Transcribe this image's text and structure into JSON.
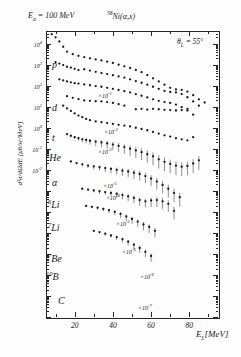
{
  "figure": {
    "beam_energy_label": "E",
    "beam_energy_sub": "α",
    "beam_energy_value": " = 100  MeV",
    "reaction_isotope": "58",
    "reaction_target": "Ni",
    "reaction_channel": "(α,x)",
    "angle_label": "θ",
    "angle_sub": "L",
    "angle_value": " = 55°"
  },
  "axes": {
    "ylabel": "d²σ/dΩdE [μb/sr/MeV]",
    "xlabel": "E",
    "xlabel_sub": "L",
    "xlabel_unit": "[MeV]",
    "y_ticks": [
      "10⁴",
      "10³",
      "10²",
      "10¹",
      "10⁰",
      "10⁻¹",
      "10⁻²"
    ],
    "y_tick_exps": [
      4,
      3,
      2,
      1,
      0,
      -1,
      -2
    ],
    "x_ticks": [
      "20",
      "40",
      "60",
      "80"
    ],
    "x_tick_values": [
      20,
      40,
      60,
      80
    ]
  },
  "chart_data": {
    "type": "scatter",
    "xlabel": "E_L [MeV]",
    "ylabel": "d²σ/dΩdE [μb/sr/MeV]",
    "xlim": [
      5,
      95
    ],
    "ylim_exp": [
      -9,
      4.6
    ],
    "grid": false,
    "legend": "none",
    "log_y": true,
    "series": [
      {
        "name": "p",
        "label": "p",
        "scale_factor": "",
        "scale_exp": null,
        "x": [
          8,
          10,
          12,
          14,
          16,
          19,
          22,
          25,
          28,
          31,
          34,
          37,
          40,
          43,
          46,
          49,
          52,
          55,
          58,
          61,
          64,
          67,
          70,
          73,
          76,
          79,
          82,
          85,
          88
        ],
        "log_y": [
          4.45,
          4.3,
          4.1,
          3.85,
          3.62,
          3.5,
          3.42,
          3.36,
          3.3,
          3.25,
          3.2,
          3.14,
          3.08,
          3.0,
          2.92,
          2.84,
          2.75,
          2.64,
          2.5,
          2.35,
          2.2,
          2.05,
          1.9,
          1.82,
          1.8,
          1.72,
          1.55,
          1.35,
          1.2
        ],
        "has_errorbars": false
      },
      {
        "name": "d",
        "label": "d",
        "scale_factor": "×10⁻¹",
        "scale_exp": -1,
        "x": [
          10,
          12,
          14,
          16,
          18,
          20,
          22,
          25,
          28,
          31,
          34,
          37,
          40,
          43,
          46,
          49,
          52,
          55,
          58,
          61,
          64,
          67,
          70,
          73,
          76,
          79,
          82,
          85
        ],
        "log_y": [
          3.12,
          3.05,
          2.98,
          2.9,
          2.86,
          2.8,
          2.74,
          2.78,
          2.72,
          2.66,
          2.6,
          2.55,
          2.5,
          2.44,
          2.38,
          2.3,
          2.22,
          2.14,
          2.05,
          1.95,
          1.85,
          1.75,
          1.7,
          1.68,
          1.6,
          1.45,
          1.25,
          1.05
        ],
        "has_errorbars": false
      },
      {
        "name": "t",
        "label": "t",
        "scale_factor": "×10⁻²",
        "scale_exp": -2,
        "x": [
          12,
          14,
          16,
          18,
          20,
          22,
          25,
          28,
          31,
          34,
          37,
          40,
          43,
          46,
          49,
          52,
          55,
          58,
          61,
          64,
          67,
          70,
          73,
          76,
          79,
          82
        ],
        "log_y": [
          2.3,
          2.25,
          2.2,
          2.16,
          2.12,
          2.1,
          2.06,
          2.02,
          1.98,
          1.95,
          1.9,
          1.85,
          1.8,
          1.74,
          1.68,
          1.6,
          1.52,
          1.44,
          1.35,
          1.28,
          1.22,
          1.18,
          1.1,
          0.98,
          0.82,
          0.62
        ],
        "has_errorbars": false
      },
      {
        "name": "3He",
        "label_iso": "3",
        "label": "He",
        "scale_factor": "×10⁻³",
        "scale_exp": -3,
        "x": [
          16,
          19,
          22,
          25,
          28,
          31,
          34,
          37,
          40,
          43,
          46,
          52,
          55,
          58,
          61,
          64,
          67,
          70,
          73,
          76,
          79
        ],
        "log_y": [
          1.5,
          1.42,
          1.36,
          1.3,
          1.28,
          1.26,
          1.25,
          1.22,
          1.18,
          1.12,
          1.05,
          0.88,
          0.9,
          0.86,
          0.9,
          0.88,
          0.85,
          0.84,
          0.82,
          0.84,
          0.9
        ],
        "has_errorbars": false
      },
      {
        "name": "alpha",
        "label": "α",
        "scale_factor": "×10⁻⁵",
        "scale_exp": -5,
        "x": [
          14,
          16,
          18,
          20,
          22,
          24,
          26,
          28,
          31,
          34,
          37,
          40,
          43,
          46,
          49,
          52,
          55,
          58,
          61,
          64,
          67,
          70,
          73,
          76,
          79,
          82
        ],
        "log_y": [
          1.05,
          0.92,
          0.8,
          0.68,
          0.58,
          0.5,
          0.42,
          0.36,
          0.3,
          0.26,
          0.22,
          0.18,
          0.14,
          0.1,
          0.06,
          0.0,
          -0.06,
          -0.12,
          -0.2,
          -0.28,
          -0.36,
          -0.42,
          -0.5,
          -0.55,
          -0.6,
          -0.45
        ],
        "has_errorbars": false
      },
      {
        "name": "6Li",
        "label_iso": "6",
        "label": "Li",
        "scale_factor": "×10⁻⁴",
        "scale_exp": -4,
        "x": [
          16,
          18,
          20,
          22,
          24,
          26,
          28,
          31,
          34,
          37,
          40,
          43,
          46,
          49,
          52,
          55,
          58,
          61,
          64,
          67,
          70,
          73,
          76,
          79,
          82,
          85
        ],
        "log_y": [
          -0.3,
          -0.38,
          -0.45,
          -0.5,
          -0.55,
          -0.58,
          -0.62,
          -0.66,
          -0.7,
          -0.74,
          -0.8,
          -0.86,
          -0.92,
          -1.0,
          -1.08,
          -1.16,
          -1.26,
          -1.36,
          -1.5,
          -1.62,
          -1.72,
          -1.8,
          -1.85,
          -1.82,
          -1.7,
          -1.55
        ],
        "has_errorbars": true
      },
      {
        "name": "7Li",
        "label_iso": "7",
        "label": "Li",
        "scale_factor": "×10⁻⁵",
        "scale_exp": -5,
        "x": [
          18,
          21,
          24,
          27,
          30,
          33,
          36,
          39,
          42,
          45,
          48,
          51,
          54,
          57,
          60,
          63,
          66,
          69,
          72,
          75
        ],
        "log_y": [
          -1.6,
          -1.68,
          -1.74,
          -1.8,
          -1.84,
          -1.88,
          -1.92,
          -1.96,
          -2.0,
          -2.04,
          -2.08,
          -2.14,
          -2.2,
          -2.3,
          -2.42,
          -2.56,
          -2.72,
          -2.9,
          -3.1,
          -3.3
        ],
        "has_errorbars": true
      },
      {
        "name": "7Be",
        "label_iso": "7",
        "label": "Be",
        "scale_factor": "×10⁻⁶",
        "scale_exp": -6,
        "x": [
          24,
          27,
          30,
          33,
          36,
          39,
          42,
          45,
          48,
          51,
          54,
          57,
          60,
          63,
          66,
          69,
          72
        ],
        "log_y": [
          -2.9,
          -2.94,
          -2.98,
          -3.02,
          -3.06,
          -3.1,
          -3.14,
          -3.2,
          -3.26,
          -3.34,
          -3.44,
          -3.5,
          -3.46,
          -3.44,
          -3.5,
          -3.62,
          -3.95
        ],
        "has_errorbars": true
      },
      {
        "name": "10B",
        "label_iso": "10",
        "label": "B",
        "scale_factor": "×10⁻⁶",
        "scale_exp": -6,
        "x": [
          26,
          29,
          32,
          35,
          38,
          41,
          44,
          47,
          50,
          53,
          56,
          59,
          62
        ],
        "log_y": [
          -3.72,
          -3.76,
          -3.8,
          -3.86,
          -3.92,
          -4.0,
          -4.1,
          -4.22,
          -4.34,
          -4.46,
          -4.6,
          -4.72,
          -4.9
        ],
        "has_errorbars": true
      },
      {
        "name": "C",
        "label": "C",
        "scale_factor": "×10⁻⁷",
        "scale_exp": -7,
        "x": [
          30,
          33,
          36,
          39,
          42,
          45,
          48,
          51,
          54,
          57,
          60
        ],
        "log_y": [
          -4.9,
          -4.96,
          -5.04,
          -5.12,
          -5.2,
          -5.3,
          -5.42,
          -5.56,
          -5.72,
          -5.9,
          -6.1
        ],
        "has_errorbars": true
      }
    ],
    "species_labels": [
      {
        "text": "p",
        "x": 52,
        "y": 60
      },
      {
        "text": "d",
        "x": 52,
        "y": 103
      },
      {
        "text": "t",
        "x": 52,
        "y": 133
      },
      {
        "text": "He",
        "iso": "3",
        "x": 46,
        "y": 152
      },
      {
        "text": "α",
        "x": 52,
        "y": 178
      },
      {
        "text": "Li",
        "iso": "6",
        "x": 48,
        "y": 199
      },
      {
        "text": "Li",
        "iso": "7",
        "x": 48,
        "y": 222
      },
      {
        "text": "Be",
        "iso": "7",
        "x": 48,
        "y": 253
      },
      {
        "text": "B",
        "iso": "10",
        "x": 46,
        "y": 271
      },
      {
        "text": "C",
        "x": 58,
        "y": 296
      }
    ],
    "scale_annotations": [
      {
        "text": "×10",
        "exp": "-1",
        "x": 98,
        "y": 91
      },
      {
        "text": "×10",
        "exp": "-2",
        "x": 104,
        "y": 127
      },
      {
        "text": "×10",
        "exp": "-3",
        "x": 98,
        "y": 147
      },
      {
        "text": "×10",
        "exp": "-5",
        "x": 103,
        "y": 181
      },
      {
        "text": "×10",
        "exp": "-4",
        "x": 106,
        "y": 193
      },
      {
        "text": "×10",
        "exp": "-5",
        "x": 116,
        "y": 219
      },
      {
        "text": "×10",
        "exp": "-6",
        "x": 122,
        "y": 247
      },
      {
        "text": "×10",
        "exp": "-6",
        "x": 140,
        "y": 272
      },
      {
        "text": "×10",
        "exp": "-7",
        "x": 138,
        "y": 303
      }
    ]
  }
}
